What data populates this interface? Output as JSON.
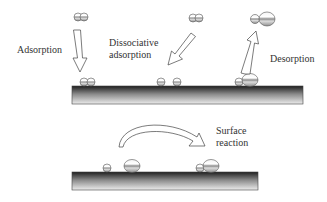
{
  "diagram": {
    "labels": {
      "adsorption": "Adsorption",
      "dissociative_line1": "Dissociative",
      "dissociative_line2": "adsorption",
      "desorption": "Desorption",
      "surface_reaction_line1": "Surface",
      "surface_reaction_line2": "reaction"
    },
    "panels": [
      {
        "name": "top-surface",
        "processes": [
          "Adsorption",
          "Dissociative adsorption",
          "Desorption"
        ]
      },
      {
        "name": "bottom-surface",
        "processes": [
          "Surface reaction"
        ]
      }
    ],
    "colors": {
      "surface_dark": "#222222",
      "surface_light": "#e8e8e8",
      "atom_stroke": "#555555",
      "arrow_stroke": "#444444"
    }
  }
}
